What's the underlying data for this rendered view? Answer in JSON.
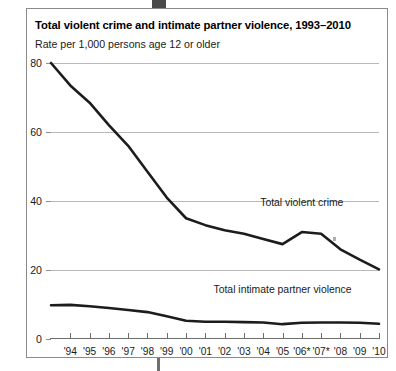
{
  "figure": {
    "title": "Total violent crime and intimate partner violence, 1993–2010",
    "subtitle": "Rate per 1,000 persons age 12 or older"
  },
  "chart_data": {
    "type": "line",
    "title": "Total violent crime and intimate partner violence, 1993–2010",
    "subtitle": "Rate per 1,000 persons age 12 or older",
    "xlabel": "",
    "ylabel": "Rate per 1,000 persons age 12 or older",
    "grid": true,
    "legend_position": "inline-annotation",
    "xlim": [
      1993,
      2010
    ],
    "ylim": [
      0,
      80
    ],
    "yticks": [
      0,
      20,
      40,
      60,
      80
    ],
    "ytick_labels": [
      "0",
      "20",
      "40",
      "60",
      "80"
    ],
    "x": [
      1993,
      1994,
      1995,
      1996,
      1997,
      1998,
      1999,
      2000,
      2001,
      2002,
      2003,
      2004,
      2005,
      2006,
      2007,
      2008,
      2009,
      2010
    ],
    "xtick_labels": [
      "",
      "'94",
      "'95",
      "'96",
      "'97",
      "'98",
      "'99",
      "'00",
      "'01",
      "'02",
      "'03",
      "'04",
      "'05",
      "'06*",
      "'07*",
      "'08",
      "'09",
      "'10"
    ],
    "series": [
      {
        "name": "Total violent crime",
        "values": [
          80.0,
          73.5,
          68.5,
          62.0,
          56.0,
          48.5,
          41.0,
          35.0,
          33.0,
          31.5,
          30.5,
          29.0,
          27.5,
          31.0,
          30.5,
          26.0,
          23.0,
          20.2
        ]
      },
      {
        "name": "Total intimate partner violence",
        "values": [
          9.8,
          9.9,
          9.5,
          9.0,
          8.4,
          7.8,
          6.6,
          5.3,
          5.0,
          5.0,
          4.9,
          4.8,
          4.3,
          4.7,
          4.8,
          4.8,
          4.7,
          4.4
        ]
      }
    ],
    "annotations": [
      {
        "text": "Total violent crime",
        "x": 2006,
        "y": 39
      },
      {
        "text": "Total intimate partner violence",
        "x": 2005,
        "y": 14
      }
    ]
  }
}
